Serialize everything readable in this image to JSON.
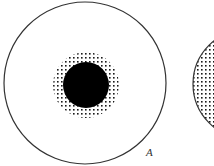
{
  "figure": {
    "panels": [
      {
        "id": "panel-a",
        "label": "A",
        "outer_circle": {
          "cx": 85,
          "cy": 83,
          "r": 81
        },
        "stipple_halo": {
          "cx": 86,
          "cy": 85,
          "r": 33
        },
        "solid_core": {
          "cx": 86,
          "cy": 85,
          "r": 23
        }
      },
      {
        "id": "panel-b",
        "label": "",
        "outer_circle": {
          "cx": 248,
          "cy": 84,
          "r": 55
        },
        "fill": "stippled"
      }
    ],
    "colors": {
      "background": "#ffffff",
      "stroke": "#333333",
      "core": "#000000",
      "dots": "#1a1a1a"
    }
  }
}
